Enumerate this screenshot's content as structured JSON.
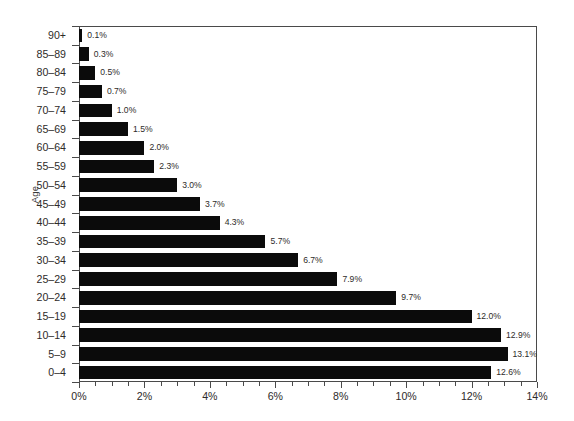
{
  "chart_data": {
    "type": "bar",
    "orientation": "horizontal",
    "title": "",
    "xlabel": "",
    "ylabel": "Age",
    "xlim": [
      0,
      14
    ],
    "ylim": null,
    "grid": false,
    "legend": null,
    "x_tick_labels": [
      "0%",
      "2%",
      "4%",
      "6%",
      "8%",
      "10%",
      "12%",
      "14%"
    ],
    "x_tick_values": [
      0,
      2,
      4,
      6,
      8,
      10,
      12,
      14
    ],
    "x_minor_tick_step": 0.5,
    "categories": [
      "90+",
      "85–89",
      "80–84",
      "75–79",
      "70–74",
      "65–69",
      "60–64",
      "55–59",
      "50–54",
      "45–49",
      "40–44",
      "35–39",
      "30–34",
      "25–29",
      "20–24",
      "15–19",
      "10–14",
      "5–9",
      "0–4"
    ],
    "values": [
      0.1,
      0.3,
      0.5,
      0.7,
      1.0,
      1.5,
      2.0,
      2.3,
      3.0,
      3.7,
      4.3,
      5.7,
      6.7,
      7.9,
      9.7,
      12.0,
      12.9,
      13.1,
      12.6
    ],
    "data_labels": [
      "0.1%",
      "0.3%",
      "0.5%",
      "0.7%",
      "1.0%",
      "1.5%",
      "2.0%",
      "2.3%",
      "3.0%",
      "3.7%",
      "4.3%",
      "5.7%",
      "6.7%",
      "7.9%",
      "9.7%",
      "12.0%",
      "12.9%",
      "13.1%",
      "12.6%"
    ],
    "bar_color": "#0b0b0b",
    "background_color": "#ffffff",
    "axis_color": "#4a4a4a",
    "text_color": "#2e2b29"
  }
}
